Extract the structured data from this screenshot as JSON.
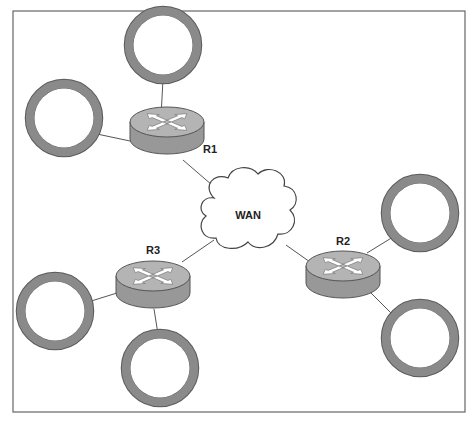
{
  "diagram": {
    "title": "",
    "frame": {
      "x": 13,
      "y": 11,
      "width": 452,
      "height": 401
    },
    "colors": {
      "ring": "#8a8a8a",
      "ring_edge": "#5a5a5a",
      "router_top": "#b4b4b4",
      "router_side": "#989898",
      "router_edge": "#555555",
      "arrow": "#ffffff",
      "line": "#555555",
      "cloud_fill": "#ffffff",
      "cloud_stroke": "#444444",
      "frame": "#666666"
    },
    "cloud": {
      "id": "wan",
      "label": "WAN",
      "cx": 248,
      "cy": 215
    },
    "routers": [
      {
        "id": "r1",
        "label": "R1",
        "cx": 167,
        "cy": 128,
        "label_x": 210,
        "label_y": 153
      },
      {
        "id": "r2",
        "label": "R2",
        "cx": 343,
        "cy": 272,
        "label_x": 343,
        "label_y": 245
      },
      {
        "id": "r3",
        "label": "R3",
        "cx": 153,
        "cy": 282,
        "label_x": 153,
        "label_y": 254
      }
    ],
    "hosts": [
      {
        "id": "r1-top",
        "router": "r1",
        "cx": 163,
        "cy": 45
      },
      {
        "id": "r1-left",
        "router": "r1",
        "cx": 64,
        "cy": 118
      },
      {
        "id": "r2-upper",
        "router": "r2",
        "cx": 420,
        "cy": 213
      },
      {
        "id": "r2-lower",
        "router": "r2",
        "cx": 420,
        "cy": 338
      },
      {
        "id": "r3-left",
        "router": "r3",
        "cx": 55,
        "cy": 311
      },
      {
        "id": "r3-bottom",
        "router": "r3",
        "cx": 160,
        "cy": 368
      }
    ],
    "links": [
      {
        "from": "r1",
        "to": "wan"
      },
      {
        "from": "r2",
        "to": "wan"
      },
      {
        "from": "r3",
        "to": "wan"
      },
      {
        "from": "r1",
        "to": "r1-top"
      },
      {
        "from": "r1",
        "to": "r1-left"
      },
      {
        "from": "r2",
        "to": "r2-upper"
      },
      {
        "from": "r2",
        "to": "r2-lower"
      },
      {
        "from": "r3",
        "to": "r3-left"
      },
      {
        "from": "r3",
        "to": "r3-bottom"
      }
    ]
  }
}
